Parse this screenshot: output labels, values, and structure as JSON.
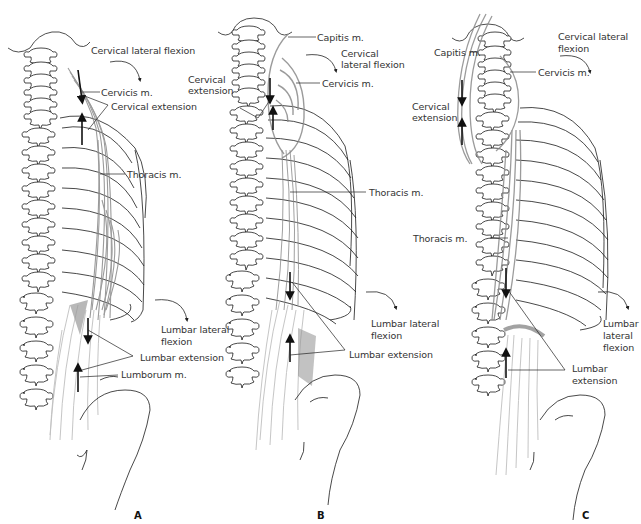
{
  "figure": {
    "panels": [
      {
        "letter": "A",
        "labels": {
          "cervical_lateral_flexion": "Cervical lateral flexion",
          "cervicis": "Cervicis m.",
          "cervical_extension": "Cervical extension",
          "thoracis": "Thoracis m.",
          "lumbar_lateral_flexion_1": "Lumbar lateral",
          "lumbar_lateral_flexion_2": "flexion",
          "lumbar_extension": "Lumbar extension",
          "lumborum": "Lumborum m."
        }
      },
      {
        "letter": "B",
        "labels": {
          "capitis": "Capitis m.",
          "cervical_lateral_flexion_1": "Cervical",
          "cervical_lateral_flexion_2": "lateral flexion",
          "cervical_extension_1": "Cervical",
          "cervical_extension_2": "extension",
          "cervicis": "Cervicis m.",
          "thoracis": "Thoracis m.",
          "lumbar_lateral_flexion_1": "Lumbar lateral",
          "lumbar_lateral_flexion_2": "flexion",
          "lumbar_extension": "Lumbar extension"
        }
      },
      {
        "letter": "C",
        "labels": {
          "capitis": "Capitis m.",
          "cervical_lateral_flexion_1": "Cervical lateral",
          "cervical_lateral_flexion_2": "flexion",
          "cervicis": "Cervicis m.",
          "cervical_extension_1": "Cervical",
          "cervical_extension_2": "extension",
          "thoracis": "Thoracis m.",
          "lumbar_lateral_flexion_1": "Lumbar",
          "lumbar_lateral_flexion_2": "lateral",
          "lumbar_lateral_flexion_3": "flexion",
          "lumbar_extension_1": "Lumbar",
          "lumbar_extension_2": "extension"
        }
      }
    ]
  },
  "colors": {
    "line": "#1a1a1a",
    "muscle": "#8a8a8a",
    "muscle_light": "#b5b5b5",
    "text": "#333333"
  }
}
